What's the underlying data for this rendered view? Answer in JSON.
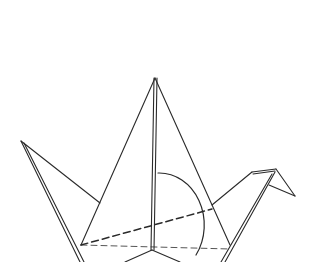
{
  "image": {
    "subject": "Origami crane line drawing",
    "stroke_color": "#2a2a2a",
    "background": "#ffffff"
  }
}
